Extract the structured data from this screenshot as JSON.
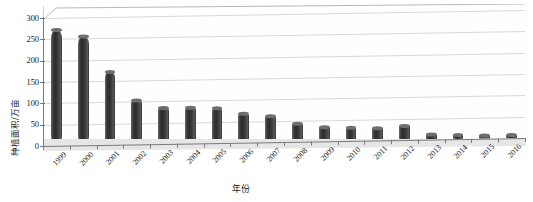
{
  "chart_data": {
    "type": "bar",
    "title": "",
    "xlabel": "年份",
    "ylabel": "种植面积/万亩",
    "categories": [
      "1999",
      "2000",
      "2001",
      "2002",
      "2003",
      "2004",
      "2005",
      "2006",
      "2007",
      "2008",
      "2009",
      "2010",
      "2011",
      "2012",
      "2013",
      "2014",
      "2015",
      "2016"
    ],
    "values": [
      272,
      255,
      172,
      103,
      85,
      84,
      82,
      67,
      62,
      42,
      32,
      30,
      29,
      33,
      12,
      9,
      8,
      7
    ],
    "yticks": [
      "0",
      "50",
      "100",
      "150",
      "200",
      "250",
      "300"
    ],
    "ytick_values": [
      0,
      50,
      100,
      150,
      200,
      250,
      300
    ],
    "ylim": [
      0,
      300
    ],
    "grid": true,
    "legend": false,
    "style_3d": true,
    "bar_color": "#333333",
    "gridline_color": "#d9d9d9",
    "axis_color": "#7a7a7a"
  }
}
